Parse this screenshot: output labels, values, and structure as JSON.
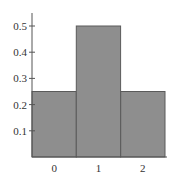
{
  "chart_data": {
    "type": "bar",
    "title": "",
    "xlabel": "",
    "ylabel": "",
    "categories": [
      "0",
      "1",
      "2"
    ],
    "values": [
      0.25,
      0.5,
      0.25
    ],
    "ylim": [
      0,
      0.55
    ],
    "yticks": [
      0.1,
      0.2,
      0.3,
      0.4,
      0.5
    ],
    "ytick_labels": [
      "0.1",
      "0.2",
      "0.3",
      "0.4",
      "0.5"
    ],
    "grid": false,
    "legend": null,
    "bar_width": 1.0,
    "colors": {
      "bar_fill": "#8e8e8e",
      "bar_edge": "#5a5a5a",
      "axis": "#555555"
    }
  }
}
